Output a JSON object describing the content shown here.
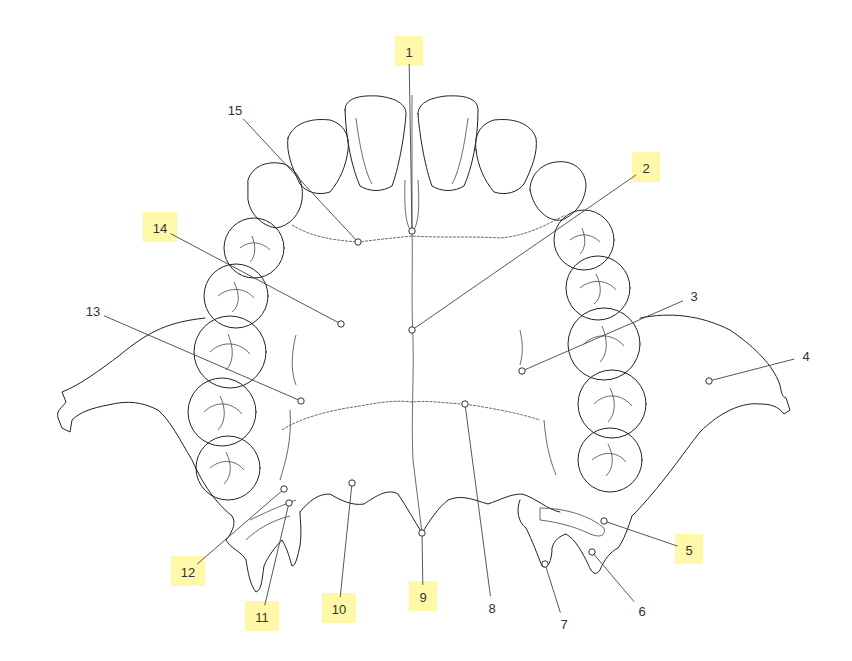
{
  "diagram": {
    "highlight_color": "#fff79a",
    "line_color": "#222222",
    "labels": [
      {
        "id": "1",
        "text": "1",
        "highlighted": true,
        "x": 409,
        "y": 52,
        "target": [
          412,
          231
        ]
      },
      {
        "id": "2",
        "text": "2",
        "highlighted": true,
        "x": 646,
        "y": 168,
        "target": [
          412,
          330
        ]
      },
      {
        "id": "3",
        "text": "3",
        "highlighted": false,
        "x": 694,
        "y": 296,
        "target": [
          522,
          371
        ]
      },
      {
        "id": "4",
        "text": "4",
        "highlighted": false,
        "x": 806,
        "y": 356,
        "target": [
          709,
          381
        ]
      },
      {
        "id": "5",
        "text": "5",
        "highlighted": true,
        "x": 689,
        "y": 550,
        "target": [
          604,
          521
        ]
      },
      {
        "id": "6",
        "text": "6",
        "highlighted": false,
        "x": 642,
        "y": 611,
        "target": [
          592,
          552
        ]
      },
      {
        "id": "7",
        "text": "7",
        "highlighted": false,
        "x": 564,
        "y": 624,
        "target": [
          545,
          564
        ]
      },
      {
        "id": "8",
        "text": "8",
        "highlighted": false,
        "x": 492,
        "y": 608,
        "target": [
          465,
          404
        ]
      },
      {
        "id": "9",
        "text": "9",
        "highlighted": true,
        "x": 423,
        "y": 597,
        "target": [
          422,
          533
        ]
      },
      {
        "id": "10",
        "text": "10",
        "highlighted": true,
        "x": 339,
        "y": 609,
        "target": [
          352,
          483
        ]
      },
      {
        "id": "11",
        "text": "11",
        "highlighted": true,
        "x": 262,
        "y": 617,
        "target": [
          289,
          503
        ]
      },
      {
        "id": "12",
        "text": "12",
        "highlighted": true,
        "x": 188,
        "y": 572,
        "target": [
          284,
          489
        ]
      },
      {
        "id": "13",
        "text": "13",
        "highlighted": false,
        "x": 93,
        "y": 311,
        "target": [
          301,
          401
        ]
      },
      {
        "id": "14",
        "text": "14",
        "highlighted": true,
        "x": 160,
        "y": 228,
        "target": [
          341,
          324
        ]
      },
      {
        "id": "15",
        "text": "15",
        "highlighted": false,
        "x": 235,
        "y": 110,
        "target": [
          358,
          242
        ]
      }
    ]
  }
}
